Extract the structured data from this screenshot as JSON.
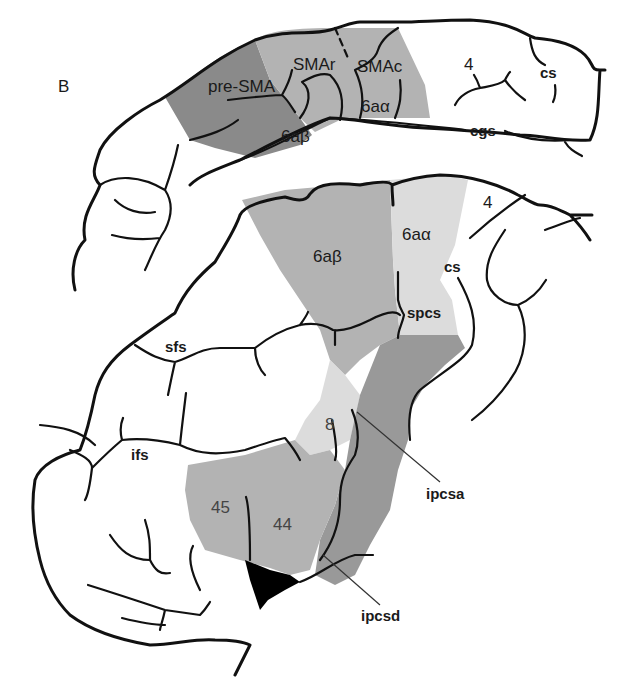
{
  "panel_label": "B",
  "colors": {
    "dark_gray": "#8a8a8a",
    "mid_gray": "#b3b3b3",
    "light_gray": "#dcdcdc",
    "darker_gray": "#999999",
    "black_region": "#000000",
    "outline": "#111111"
  },
  "medial_view": {
    "regions": [
      {
        "label": "pre-SMA",
        "shade": "dark_gray"
      },
      {
        "label": "SMAr",
        "shade": "mid_gray"
      },
      {
        "label": "SMAc",
        "shade": "mid_gray"
      },
      {
        "label": "6aβ",
        "shade": "dark_gray"
      },
      {
        "label": "6aα",
        "shade": "mid_gray"
      },
      {
        "label": "4",
        "shade": "none"
      }
    ],
    "sulci": [
      {
        "label": "cs"
      },
      {
        "label": "cgs"
      }
    ]
  },
  "lateral_view": {
    "regions": [
      {
        "label": "6aβ",
        "shade": "mid_gray"
      },
      {
        "label": "6aα",
        "shade": "light_gray"
      },
      {
        "label": "4",
        "shade": "none"
      },
      {
        "label": "8",
        "shade": "light_gray"
      },
      {
        "label": "45",
        "shade": "mid_gray"
      },
      {
        "label": "44",
        "shade": "mid_gray"
      }
    ],
    "sulci": [
      {
        "label": "cs"
      },
      {
        "label": "spcs"
      },
      {
        "label": "sfs"
      },
      {
        "label": "ifs"
      },
      {
        "label": "ipcsa"
      },
      {
        "label": "ipcsd"
      }
    ]
  }
}
